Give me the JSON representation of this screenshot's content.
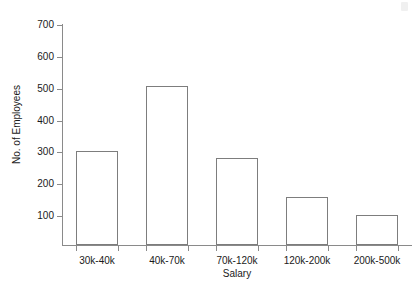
{
  "figure": {
    "caption_remnant": "",
    "background_color": "#ffffff",
    "axis_color": "#8a8a8a",
    "bar_edge_color": "#7d7d7d",
    "bar_fill_color": "#ffffff"
  },
  "chart_data": {
    "type": "bar",
    "title": "",
    "xlabel": "Salary",
    "ylabel": "No. of Employees",
    "categories": [
      "30k-40k",
      "40k-70k",
      "70k-120k",
      "120k-200k",
      "200k-500k"
    ],
    "values": [
      305,
      508,
      281,
      161,
      104
    ],
    "ylim": [
      0,
      700
    ],
    "yticks": [
      100,
      200,
      300,
      400,
      500,
      600,
      700
    ],
    "ytick_labels": [
      "100",
      "200",
      "300",
      "400",
      "500",
      "600",
      "700"
    ],
    "grid": false,
    "legend": false,
    "legend_position": "none",
    "bar_style": "outline"
  }
}
